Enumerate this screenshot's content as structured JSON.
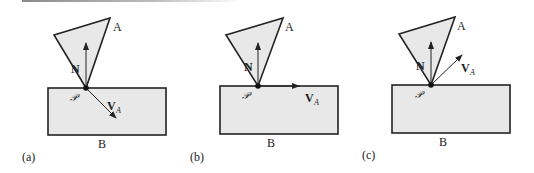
{
  "figure": {
    "colors": {
      "stroke": "#222222",
      "fill": "#e8e8e8",
      "background": "#ffffff"
    },
    "panels": [
      {
        "label": "(a)",
        "body_a_label": "A",
        "body_b_label": "B",
        "contact_point_label": "𝒫",
        "normal_label": "N",
        "velocity_label": "V",
        "velocity_subscript": "A",
        "velocity_direction": "into B (penetrating)"
      },
      {
        "label": "(b)",
        "body_a_label": "A",
        "body_b_label": "B",
        "contact_point_label": "𝒫",
        "normal_label": "N",
        "velocity_label": "V",
        "velocity_subscript": "A",
        "velocity_direction": "tangent to B surface (resting)"
      },
      {
        "label": "(c)",
        "body_a_label": "A",
        "body_b_label": "B",
        "contact_point_label": "𝒫",
        "normal_label": "N",
        "velocity_label": "V",
        "velocity_subscript": "A",
        "velocity_direction": "away from B (separating)"
      }
    ]
  }
}
